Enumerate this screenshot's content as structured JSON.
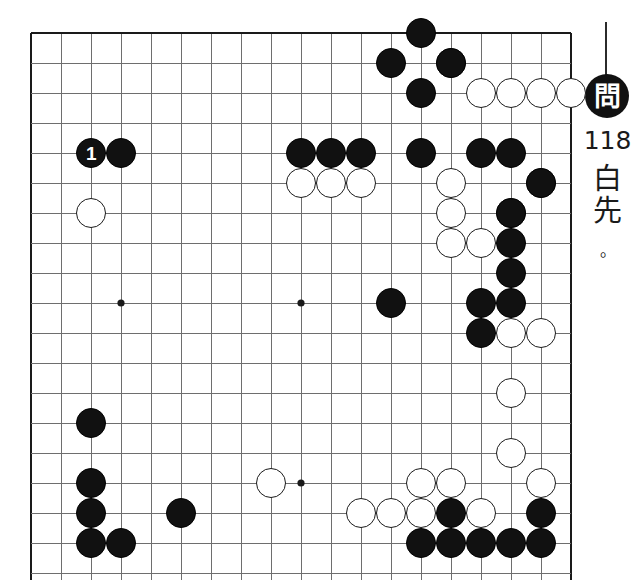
{
  "sidebar": {
    "badge_label": "問",
    "problem_number": "118",
    "turn_chars": [
      "白",
      "先"
    ],
    "turn_period": "。",
    "turn_meaning": "White to play"
  },
  "board": {
    "size": 19,
    "origin_x": 31,
    "origin_y": 33,
    "spacing": 30,
    "cols_visible": 18,
    "rows_visible": 18,
    "stone_radius": 15,
    "border_color": "#1a1a1a",
    "line_color": "#6e6e6e",
    "black_color": "#111111",
    "white_color": "#ffffff",
    "star_points": [
      [
        3,
        9
      ],
      [
        9,
        9
      ],
      [
        9,
        15
      ]
    ],
    "edges": {
      "top": true,
      "left": true,
      "right": true,
      "bottom": false
    }
  },
  "stones": {
    "black": [
      [
        2,
        4
      ],
      [
        3,
        4
      ],
      [
        13,
        0
      ],
      [
        12,
        1
      ],
      [
        14,
        1
      ],
      [
        13,
        2
      ],
      [
        9,
        4
      ],
      [
        10,
        4
      ],
      [
        11,
        4
      ],
      [
        13,
        4
      ],
      [
        15,
        4
      ],
      [
        16,
        4
      ],
      [
        17,
        5
      ],
      [
        16,
        6
      ],
      [
        16,
        7
      ],
      [
        16,
        8
      ],
      [
        15,
        9
      ],
      [
        16,
        9
      ],
      [
        12,
        9
      ],
      [
        15,
        10
      ],
      [
        2,
        13
      ],
      [
        2,
        15
      ],
      [
        2,
        16
      ],
      [
        5,
        16
      ],
      [
        2,
        17
      ],
      [
        3,
        17
      ],
      [
        14,
        16
      ],
      [
        17,
        16
      ],
      [
        13,
        17
      ],
      [
        14,
        17
      ],
      [
        15,
        17
      ],
      [
        16,
        17
      ],
      [
        17,
        17
      ]
    ],
    "white": [
      [
        2,
        6
      ],
      [
        14,
        1
      ],
      [
        15,
        2
      ],
      [
        16,
        2
      ],
      [
        17,
        2
      ],
      [
        18,
        2
      ],
      [
        9,
        5
      ],
      [
        10,
        5
      ],
      [
        11,
        5
      ],
      [
        14,
        5
      ],
      [
        17,
        5
      ],
      [
        14,
        6
      ],
      [
        16,
        6
      ],
      [
        14,
        7
      ],
      [
        15,
        7
      ],
      [
        16,
        10
      ],
      [
        17,
        10
      ],
      [
        16,
        12
      ],
      [
        16,
        14
      ],
      [
        8,
        15
      ],
      [
        13,
        15
      ],
      [
        14,
        15
      ],
      [
        17,
        15
      ],
      [
        11,
        16
      ],
      [
        12,
        16
      ],
      [
        13,
        16
      ],
      [
        15,
        16
      ]
    ],
    "labeled": [
      {
        "color": "black",
        "col": 2,
        "row": 4,
        "label": "1"
      }
    ]
  }
}
